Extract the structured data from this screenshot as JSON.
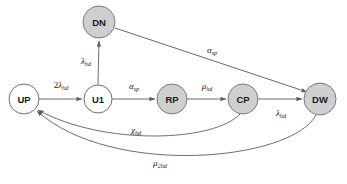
{
  "diagram": {
    "type": "state-transition-diagram",
    "title": "",
    "background_color": "#ffffff",
    "node_fill_gray": "#cfcfcf",
    "node_fill_white": "#ffffff",
    "node_stroke_color": "#6e6e6e",
    "edge_color": "#5e5e5e",
    "label_color": "#1a1a1a",
    "nodes": [
      {
        "id": "UP",
        "label": "UP",
        "x": 24,
        "y": 99,
        "r": 15,
        "fill": "white"
      },
      {
        "id": "U1",
        "label": "U1",
        "x": 98,
        "y": 99,
        "r": 14,
        "fill": "white"
      },
      {
        "id": "DN",
        "label": "DN",
        "x": 99,
        "y": 22,
        "r": 16,
        "fill": "gray"
      },
      {
        "id": "RP",
        "label": "RP",
        "x": 172,
        "y": 99,
        "r": 15,
        "fill": "gray"
      },
      {
        "id": "CP",
        "label": "CP",
        "x": 243,
        "y": 99,
        "r": 15,
        "fill": "gray"
      },
      {
        "id": "DW",
        "label": "DW",
        "x": 320,
        "y": 99,
        "r": 16,
        "fill": "gray"
      }
    ],
    "edges": [
      {
        "id": "up-to-u1",
        "from": "UP",
        "to": "U1",
        "shape": "straight",
        "label_coefficient": "2",
        "label_symbol": "λ",
        "label_subscript": "hd",
        "label_plain": "2λhd",
        "label_x": 61,
        "label_y": 85
      },
      {
        "id": "u1-to-dn",
        "from": "U1",
        "to": "DN",
        "shape": "straight",
        "label_coefficient": "",
        "label_symbol": "λ",
        "label_subscript": "hd",
        "label_plain": "λhd",
        "label_x": 86,
        "label_y": 61
      },
      {
        "id": "u1-to-rp",
        "from": "U1",
        "to": "RP",
        "shape": "straight",
        "label_coefficient": "",
        "label_symbol": "α",
        "label_subscript": "sp",
        "label_plain": "αsp",
        "label_x": 134,
        "label_y": 86
      },
      {
        "id": "rp-to-cp",
        "from": "RP",
        "to": "CP",
        "shape": "straight",
        "label_coefficient": "",
        "label_symbol": "μ",
        "label_subscript": "hd",
        "label_plain": "μhd",
        "label_x": 207,
        "label_y": 86
      },
      {
        "id": "cp-to-dw",
        "from": "CP",
        "to": "DW",
        "shape": "straight",
        "label_coefficient": "",
        "label_symbol": "λ",
        "label_subscript": "hd",
        "label_plain": "λhd",
        "label_x": 281,
        "label_y": 113
      },
      {
        "id": "dn-to-dw",
        "from": "DN",
        "to": "DW",
        "shape": "straight",
        "label_coefficient": "",
        "label_symbol": "α",
        "label_subscript": "sp",
        "label_plain": "αsp",
        "label_x": 212,
        "label_y": 50
      },
      {
        "id": "cp-to-up",
        "from": "CP",
        "to": "UP",
        "shape": "curve",
        "label_coefficient": "",
        "label_symbol": "χ",
        "label_subscript": "hd",
        "label_plain": "χhd",
        "label_x": 136,
        "label_y": 130
      },
      {
        "id": "dw-to-up",
        "from": "DW",
        "to": "UP",
        "shape": "curve",
        "label_coefficient": "",
        "label_symbol": "μ",
        "label_subscript": "2hd",
        "label_plain": "μ2hd",
        "label_x": 160,
        "label_y": 163
      }
    ]
  }
}
